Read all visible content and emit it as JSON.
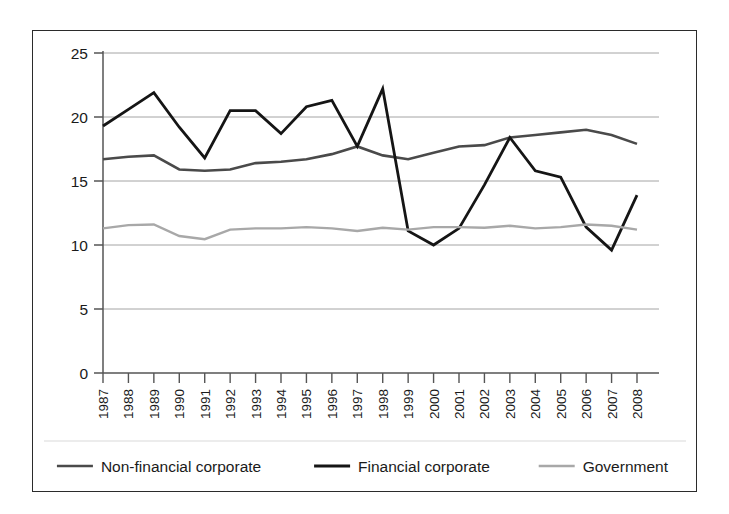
{
  "chart_data": {
    "type": "line",
    "title": "",
    "subtitle": "",
    "xlabel": "",
    "ylabel": "",
    "xlim": [
      "1987",
      "2008"
    ],
    "ylim": [
      0,
      25
    ],
    "y_ticks": [
      0,
      5,
      10,
      15,
      20,
      25
    ],
    "y_tick_labels": [
      "0",
      "5",
      "10",
      "15",
      "20",
      "25"
    ],
    "grid": "horizontal",
    "legend_position": "bottom",
    "x_tick_rotation": -90,
    "categories": [
      "1987",
      "1988",
      "1989",
      "1990",
      "1991",
      "1992",
      "1993",
      "1994",
      "1995",
      "1996",
      "1997",
      "1998",
      "1999",
      "2000",
      "2001",
      "2002",
      "2003",
      "2004",
      "2005",
      "2006",
      "2007",
      "2008"
    ],
    "series": [
      {
        "name": "Non-financial corporate",
        "color": "#4a4a4a",
        "width": 2.6,
        "values": [
          16.7,
          16.9,
          17.0,
          15.9,
          15.8,
          15.9,
          16.4,
          16.5,
          16.7,
          17.1,
          17.7,
          17.0,
          16.7,
          17.2,
          17.7,
          17.8,
          18.4,
          18.6,
          18.8,
          19.0,
          18.6,
          17.9
        ]
      },
      {
        "name": "Financial corporate",
        "color": "#151515",
        "width": 2.8,
        "values": [
          19.3,
          20.6,
          21.9,
          19.2,
          16.8,
          20.5,
          20.5,
          18.7,
          20.8,
          21.3,
          17.7,
          22.2,
          11.1,
          10.0,
          11.3,
          14.7,
          18.4,
          15.8,
          15.3,
          11.4,
          9.6,
          13.9
        ]
      },
      {
        "name": "Government",
        "color": "#a8a8a8",
        "width": 2.4,
        "values": [
          11.3,
          11.55,
          11.6,
          10.7,
          10.45,
          11.2,
          11.3,
          11.3,
          11.4,
          11.3,
          11.1,
          11.35,
          11.2,
          11.4,
          11.4,
          11.35,
          11.5,
          11.3,
          11.4,
          11.6,
          11.5,
          11.2
        ]
      }
    ]
  },
  "legend": {
    "items": [
      {
        "label": "Non-financial corporate",
        "color": "#4a4a4a",
        "width": 2.6
      },
      {
        "label": "Financial corporate",
        "color": "#151515",
        "width": 2.8
      },
      {
        "label": "Government",
        "color": "#a8a8a8",
        "width": 2.4
      }
    ]
  },
  "axes": {
    "axis_color": "#555555",
    "grid_color": "#9a9a9a",
    "frame_color": "#2b2b2b"
  }
}
